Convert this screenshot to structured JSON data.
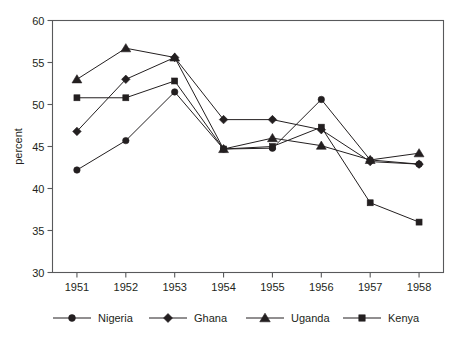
{
  "chart_data": {
    "type": "line",
    "title": "",
    "xlabel": "",
    "ylabel": "percent",
    "x": [
      "1951",
      "1952",
      "1953",
      "1954",
      "1955",
      "1956",
      "1957",
      "1958"
    ],
    "categories": [
      "1951",
      "1952",
      "1953",
      "1954",
      "1955",
      "1956",
      "1957",
      "1958"
    ],
    "ylim": [
      30,
      60
    ],
    "yticks": [
      30,
      35,
      40,
      45,
      50,
      55,
      60
    ],
    "ytick_labels": [
      "30",
      "35",
      "40",
      "45",
      "50",
      "55",
      "60"
    ],
    "grid": false,
    "legend_position": "bottom",
    "series": [
      {
        "name": "Nigeria",
        "marker": "circle",
        "values": [
          42.2,
          45.7,
          51.5,
          44.7,
          44.8,
          50.6,
          43.4,
          42.9
        ]
      },
      {
        "name": "Ghana",
        "marker": "diamond",
        "values": [
          46.8,
          53.0,
          55.6,
          48.2,
          48.2,
          47.0,
          43.2,
          42.9
        ]
      },
      {
        "name": "Uganda",
        "marker": "triangle",
        "values": [
          53.0,
          56.7,
          55.6,
          44.7,
          46.0,
          45.1,
          43.4,
          44.2
        ]
      },
      {
        "name": "Kenya",
        "marker": "square",
        "values": [
          50.8,
          50.8,
          52.8,
          44.7,
          45.0,
          47.3,
          38.3,
          36.0
        ]
      }
    ]
  },
  "legend": {
    "entries": [
      {
        "label": "Nigeria",
        "marker": "circle"
      },
      {
        "label": "Ghana",
        "marker": "diamond"
      },
      {
        "label": "Uganda",
        "marker": "triangle"
      },
      {
        "label": "Kenya",
        "marker": "square"
      }
    ]
  },
  "colors": {
    "line": "#231f20",
    "marker": "#231f20",
    "axis": "#58595b",
    "background": "#ffffff"
  }
}
